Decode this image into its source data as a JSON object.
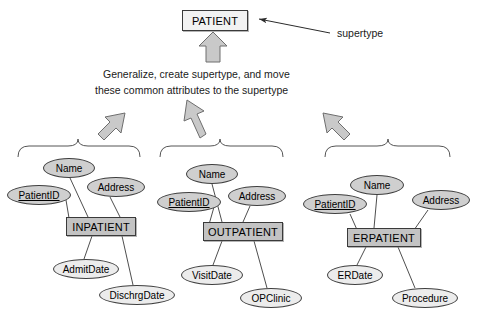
{
  "diagram": {
    "type": "er-generalization",
    "supertype_label": "supertype",
    "instruction": {
      "line1": "Generalize, create supertype, and move",
      "line2": "these common attributes to the supertype"
    },
    "supertype": {
      "name": "PATIENT",
      "x": 182,
      "y": 10,
      "w": 66,
      "h": 21
    },
    "subtypes": [
      {
        "name": "INPATIENT",
        "x": 66,
        "y": 217,
        "w": 70,
        "h": 19,
        "attributes": [
          {
            "label": "Name",
            "x": 43,
            "y": 158,
            "w": 52,
            "h": 20,
            "shaded": true,
            "key": false
          },
          {
            "label": "PatientID",
            "x": 7,
            "y": 185,
            "w": 64,
            "h": 20,
            "shaded": true,
            "key": true
          },
          {
            "label": "Address",
            "x": 87,
            "y": 177,
            "w": 58,
            "h": 20,
            "shaded": true,
            "key": false
          },
          {
            "label": "AdmitDate",
            "x": 53,
            "y": 259,
            "w": 66,
            "h": 20,
            "shaded": false,
            "key": false
          },
          {
            "label": "DischrgDate",
            "x": 99,
            "y": 285,
            "w": 76,
            "h": 20,
            "shaded": false,
            "key": false
          }
        ]
      },
      {
        "name": "OUTPATIENT",
        "x": 203,
        "y": 222,
        "w": 80,
        "h": 19,
        "attributes": [
          {
            "label": "Name",
            "x": 186,
            "y": 164,
            "w": 52,
            "h": 20,
            "shaded": true,
            "key": false
          },
          {
            "label": "PatientID",
            "x": 157,
            "y": 192,
            "w": 64,
            "h": 20,
            "shaded": true,
            "key": true
          },
          {
            "label": "Address",
            "x": 228,
            "y": 186,
            "w": 58,
            "h": 20,
            "shaded": true,
            "key": false
          },
          {
            "label": "VisitDate",
            "x": 181,
            "y": 265,
            "w": 62,
            "h": 20,
            "shaded": false,
            "key": false
          },
          {
            "label": "OPClinic",
            "x": 240,
            "y": 288,
            "w": 62,
            "h": 20,
            "shaded": false,
            "key": false
          }
        ]
      },
      {
        "name": "ERPATIENT",
        "x": 347,
        "y": 228,
        "w": 74,
        "h": 19,
        "attributes": [
          {
            "label": "Name",
            "x": 350,
            "y": 175,
            "w": 54,
            "h": 20,
            "shaded": true,
            "key": false
          },
          {
            "label": "PatientID",
            "x": 303,
            "y": 194,
            "w": 64,
            "h": 20,
            "shaded": true,
            "key": true
          },
          {
            "label": "Address",
            "x": 412,
            "y": 190,
            "w": 58,
            "h": 20,
            "shaded": true,
            "key": false
          },
          {
            "label": "ERDate",
            "x": 327,
            "y": 265,
            "w": 56,
            "h": 20,
            "shaded": false,
            "key": false
          },
          {
            "label": "Procedure",
            "x": 392,
            "y": 288,
            "w": 66,
            "h": 20,
            "shaded": false,
            "key": false
          }
        ]
      }
    ]
  }
}
